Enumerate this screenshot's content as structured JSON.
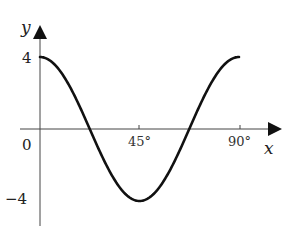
{
  "chart_data": {
    "type": "line",
    "title": "",
    "function": "y = 4cos(4x)",
    "xlabel": "x",
    "ylabel": "y",
    "x_units": "degrees",
    "xlim": [
      0,
      90
    ],
    "ylim": [
      -4,
      4
    ],
    "x_ticks": [
      {
        "value": 45,
        "label": "45°"
      },
      {
        "value": 90,
        "label": "90°"
      }
    ],
    "y_ticks": [
      {
        "value": 4,
        "label": "4"
      },
      {
        "value": 0,
        "label": "0"
      },
      {
        "value": -4,
        "label": "-4"
      }
    ],
    "origin_label": "0",
    "grid": false,
    "legend": null,
    "series": [
      {
        "name": "curve",
        "x": [
          0,
          11.25,
          22.5,
          33.75,
          45,
          56.25,
          67.5,
          78.75,
          90
        ],
        "values": [
          4,
          2.83,
          0,
          -2.83,
          -4,
          -2.83,
          0,
          2.83,
          4
        ]
      }
    ]
  },
  "labels": {
    "y_axis": "y",
    "x_axis": "x",
    "y_tick_top": "4",
    "origin": "0",
    "y_tick_bottom": "−4",
    "x_tick_45": "45°",
    "x_tick_90": "90°"
  },
  "colors": {
    "curve": "#111111",
    "axis": "#333333",
    "background": "#ffffff"
  }
}
